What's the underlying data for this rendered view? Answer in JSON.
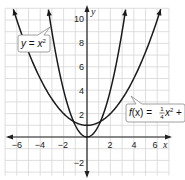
{
  "chart_data": {
    "type": "line",
    "title": "",
    "xlabel": "x",
    "ylabel": "y",
    "xlim": [
      -7,
      7
    ],
    "ylim": [
      -3,
      11
    ],
    "grid": true,
    "x_ticks": [
      -6,
      -4,
      -2,
      2,
      4,
      6
    ],
    "y_ticks": [
      10,
      8,
      6,
      4,
      2,
      -2
    ],
    "series": [
      {
        "name": "y = x^2",
        "label": "y = x²",
        "equation": "y = x^2",
        "x": [
          -3.3,
          -3,
          -2,
          -1,
          0,
          1,
          2,
          3,
          3.3
        ],
        "values": [
          10.9,
          9,
          4,
          1,
          0,
          1,
          4,
          9,
          10.9
        ]
      },
      {
        "name": "f(x) = 1/4 x^2 + 1",
        "label": "f(x) = ¼x² + 1",
        "equation": "f(x) = (1/4)x^2 + 1",
        "x": [
          -6.3,
          -6,
          -4,
          -2,
          0,
          2,
          4,
          6,
          6.3
        ],
        "values": [
          10.9,
          10,
          5,
          2,
          1,
          2,
          5,
          10,
          10.9
        ]
      }
    ],
    "annotations": [
      {
        "text": "y = x²",
        "points_to": "y = x^2"
      },
      {
        "text": "f(x) = ¼x² + 1",
        "points_to": "f(x) = 1/4 x^2 + 1"
      }
    ]
  },
  "axes": {
    "x_label": "x",
    "y_label": "y",
    "x_tick_labels": [
      "−6",
      "−4",
      "−2",
      "2",
      "4",
      "6"
    ],
    "y_tick_labels": [
      "10",
      "8",
      "6",
      "4",
      "2",
      "−2"
    ]
  },
  "labels": {
    "parabola_a": {
      "lhs": "y",
      "eq": " = ",
      "var": "x",
      "exp": "2"
    },
    "parabola_b": {
      "fn": "f",
      "arg": "(x)",
      "eq": " = ",
      "num": "1",
      "den": "4",
      "var": "x",
      "exp": "2",
      "tail": " + 1"
    }
  }
}
